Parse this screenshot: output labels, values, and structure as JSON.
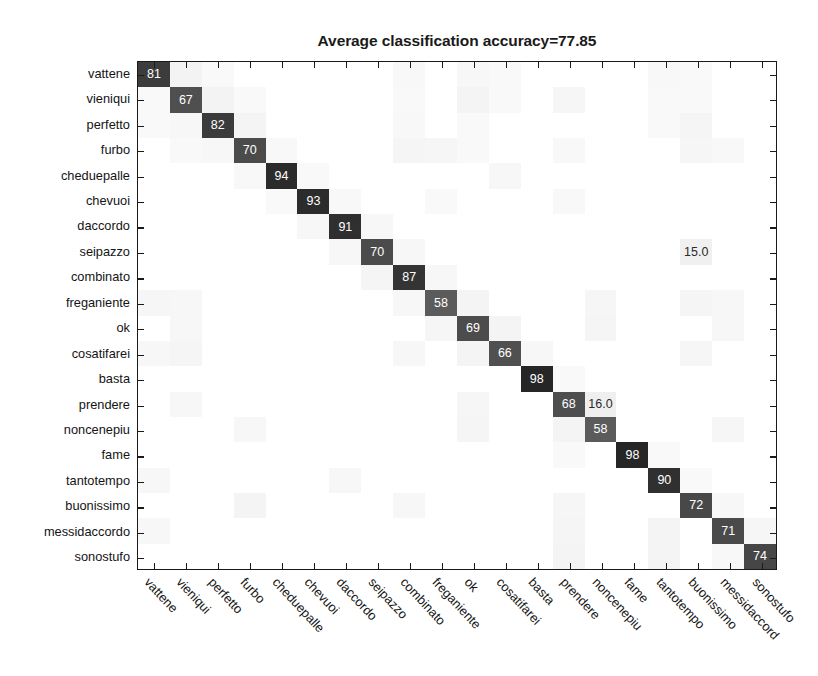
{
  "chart_data": {
    "type": "heatmap",
    "subtype": "confusion-matrix",
    "title": "Average classification accuracy=77.85",
    "average_accuracy": 77.85,
    "xlabel": "",
    "ylabel": "",
    "grid": false,
    "legend": "none",
    "value_range": [
      0,
      100
    ],
    "colormap": "gray-inverted",
    "categories": [
      "vattene",
      "vieniqui",
      "perfetto",
      "furbo",
      "cheduepalle",
      "chevuoi",
      "daccordo",
      "seipazzo",
      "combinato",
      "freganiente",
      "ok",
      "cosatifarei",
      "basta",
      "prendere",
      "noncenepiu",
      "fame",
      "tantotempo",
      "buonissimo",
      "messidaccordo",
      "sonostufo"
    ],
    "x_tick_labels": [
      "vattene",
      "vieniqui",
      "perfetto",
      "furbo",
      "cheduepalle",
      "chevuoi",
      "daccordo",
      "seipazzo",
      "combinato",
      "freganiente",
      "ok",
      "cosatifarei",
      "basta",
      "prendere",
      "noncenepiu",
      "fame",
      "tantotempo",
      "buonissimo",
      "messidaccord",
      "sonostufo"
    ],
    "y_tick_labels": [
      "vattene",
      "vieniqui",
      "perfetto",
      "furbo",
      "cheduepalle",
      "chevuoi",
      "daccordo",
      "seipazzo",
      "combinato",
      "freganiente",
      "ok",
      "cosatifarei",
      "basta",
      "prendere",
      "noncenepiu",
      "fame",
      "tantotempo",
      "buonissimo",
      "messidaccordo",
      "sonostufo"
    ],
    "diagonal_values": [
      81,
      67,
      82,
      70,
      94,
      93,
      91,
      70,
      87,
      58,
      69,
      66,
      98,
      68,
      58,
      98,
      90,
      72,
      71,
      74
    ],
    "labeled_cells": [
      {
        "row": 0,
        "col": 0,
        "row_label": "vattene",
        "col_label": "vattene",
        "text": "81"
      },
      {
        "row": 1,
        "col": 1,
        "row_label": "vieniqui",
        "col_label": "vieniqui",
        "text": "67"
      },
      {
        "row": 2,
        "col": 2,
        "row_label": "perfetto",
        "col_label": "perfetto",
        "text": "82"
      },
      {
        "row": 3,
        "col": 3,
        "row_label": "furbo",
        "col_label": "furbo",
        "text": "70"
      },
      {
        "row": 4,
        "col": 4,
        "row_label": "cheduepalle",
        "col_label": "cheduepalle",
        "text": "94"
      },
      {
        "row": 5,
        "col": 5,
        "row_label": "chevuoi",
        "col_label": "chevuoi",
        "text": "93"
      },
      {
        "row": 6,
        "col": 6,
        "row_label": "daccordo",
        "col_label": "daccordo",
        "text": "91"
      },
      {
        "row": 7,
        "col": 7,
        "row_label": "seipazzo",
        "col_label": "seipazzo",
        "text": "70"
      },
      {
        "row": 7,
        "col": 17,
        "row_label": "seipazzo",
        "col_label": "buonissimo",
        "text": "15.0"
      },
      {
        "row": 8,
        "col": 8,
        "row_label": "combinato",
        "col_label": "combinato",
        "text": "87"
      },
      {
        "row": 9,
        "col": 9,
        "row_label": "freganiente",
        "col_label": "freganiente",
        "text": "58"
      },
      {
        "row": 10,
        "col": 10,
        "row_label": "ok",
        "col_label": "ok",
        "text": "69"
      },
      {
        "row": 11,
        "col": 11,
        "row_label": "cosatifarei",
        "col_label": "cosatifarei",
        "text": "66"
      },
      {
        "row": 12,
        "col": 12,
        "row_label": "basta",
        "col_label": "basta",
        "text": "98"
      },
      {
        "row": 13,
        "col": 13,
        "row_label": "prendere",
        "col_label": "prendere",
        "text": "68"
      },
      {
        "row": 13,
        "col": 14,
        "row_label": "prendere",
        "col_label": "noncenepiu",
        "text": "16.0"
      },
      {
        "row": 14,
        "col": 14,
        "row_label": "noncenepiu",
        "col_label": "noncenepiu",
        "text": "58"
      },
      {
        "row": 15,
        "col": 15,
        "row_label": "fame",
        "col_label": "fame",
        "text": "98"
      },
      {
        "row": 16,
        "col": 16,
        "row_label": "tantotempo",
        "col_label": "tantotempo",
        "text": "90"
      },
      {
        "row": 17,
        "col": 17,
        "row_label": "buonissimo",
        "col_label": "buonissimo",
        "text": "72"
      },
      {
        "row": 18,
        "col": 18,
        "row_label": "messidaccordo",
        "col_label": "messidaccordo",
        "text": "71"
      },
      {
        "row": 19,
        "col": 19,
        "row_label": "sonostufo",
        "col_label": "sonostufo",
        "text": "74"
      }
    ],
    "matrix": [
      [
        81,
        10,
        1,
        0,
        0,
        0,
        0,
        0,
        3,
        0,
        5,
        2,
        0,
        0,
        0,
        0,
        3,
        1,
        0,
        0
      ],
      [
        2,
        67,
        10,
        1,
        0,
        0,
        0,
        0,
        2,
        0,
        8,
        1,
        0,
        6,
        0,
        0,
        1,
        1,
        0,
        0
      ],
      [
        1,
        4,
        82,
        9,
        0,
        0,
        0,
        0,
        3,
        0,
        1,
        0,
        0,
        0,
        0,
        0,
        1,
        7,
        0,
        0
      ],
      [
        0,
        1,
        5,
        70,
        3,
        0,
        0,
        0,
        7,
        6,
        1,
        0,
        0,
        3,
        0,
        0,
        0,
        6,
        3,
        0
      ],
      [
        0,
        0,
        0,
        3,
        94,
        1,
        0,
        0,
        0,
        0,
        0,
        4,
        0,
        0,
        0,
        0,
        0,
        0,
        0,
        0
      ],
      [
        0,
        0,
        0,
        0,
        2,
        93,
        3,
        0,
        0,
        1,
        0,
        0,
        0,
        3,
        0,
        0,
        0,
        0,
        0,
        0
      ],
      [
        0,
        0,
        0,
        0,
        0,
        4,
        91,
        5,
        0,
        0,
        0,
        0,
        0,
        0,
        0,
        0,
        0,
        0,
        0,
        0
      ],
      [
        0,
        0,
        0,
        0,
        0,
        0,
        4,
        70,
        5,
        0,
        0,
        0,
        0,
        0,
        0,
        0,
        0,
        15,
        0,
        0
      ],
      [
        0,
        0,
        0,
        0,
        0,
        0,
        0,
        7,
        87,
        4,
        0,
        0,
        0,
        0,
        0,
        0,
        0,
        0,
        0,
        0
      ],
      [
        6,
        5,
        0,
        0,
        0,
        0,
        0,
        0,
        5,
        58,
        9,
        0,
        0,
        0,
        6,
        0,
        0,
        7,
        4,
        0
      ],
      [
        0,
        5,
        0,
        0,
        0,
        0,
        0,
        0,
        0,
        6,
        69,
        9,
        0,
        0,
        7,
        0,
        0,
        0,
        4,
        0
      ],
      [
        5,
        7,
        0,
        0,
        0,
        0,
        0,
        0,
        5,
        0,
        8,
        66,
        5,
        0,
        0,
        0,
        0,
        6,
        0,
        0
      ],
      [
        0,
        0,
        0,
        0,
        0,
        0,
        0,
        0,
        0,
        0,
        0,
        0,
        98,
        2,
        0,
        0,
        0,
        0,
        0,
        0
      ],
      [
        0,
        4,
        0,
        0,
        0,
        0,
        0,
        0,
        0,
        0,
        6,
        0,
        0,
        68,
        16,
        0,
        0,
        0,
        0,
        0
      ],
      [
        0,
        0,
        0,
        4,
        0,
        0,
        0,
        0,
        0,
        0,
        7,
        0,
        0,
        9,
        58,
        0,
        0,
        0,
        6,
        0
      ],
      [
        0,
        0,
        0,
        0,
        0,
        0,
        0,
        0,
        0,
        0,
        0,
        0,
        0,
        1,
        0,
        98,
        1,
        0,
        0,
        0
      ],
      [
        4,
        0,
        0,
        0,
        0,
        0,
        4,
        0,
        0,
        0,
        0,
        0,
        0,
        0,
        0,
        0,
        90,
        2,
        0,
        0
      ],
      [
        0,
        0,
        0,
        9,
        0,
        0,
        0,
        0,
        5,
        0,
        0,
        0,
        0,
        6,
        0,
        0,
        0,
        72,
        5,
        0
      ],
      [
        5,
        0,
        0,
        0,
        0,
        0,
        0,
        0,
        0,
        0,
        0,
        0,
        0,
        7,
        0,
        0,
        8,
        0,
        71,
        6
      ],
      [
        0,
        0,
        0,
        0,
        0,
        0,
        0,
        0,
        0,
        0,
        0,
        0,
        0,
        9,
        0,
        0,
        9,
        0,
        3,
        74
      ]
    ]
  },
  "colors": {
    "background": "#ffffff",
    "axis": "#1a1a1a",
    "title_color": "#1a1a1a",
    "label_color": "#141414",
    "high_cell": "#2b2b2b",
    "mid_cell": "#6e6e6e",
    "faint_cell": "#e4e4e4",
    "value_text_light": "#ffffff",
    "value_text_dark": "#2b2b2b"
  }
}
